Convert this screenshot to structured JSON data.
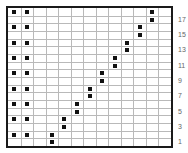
{
  "grid": {
    "columns": 13,
    "rows": 18,
    "row_labels": [
      "17",
      "15",
      "13",
      "11",
      "9",
      "7",
      "5",
      "3",
      "1"
    ],
    "row_label_rows": [
      17,
      15,
      13,
      11,
      9,
      7,
      5,
      3,
      1
    ],
    "colors": {
      "border": "#1a1a1a",
      "gridline": "#b9b9b9",
      "dot": "#111111",
      "label": "#666666"
    }
  },
  "dots": [
    {
      "col": 1,
      "row": 18
    },
    {
      "col": 2,
      "row": 18
    },
    {
      "col": 1,
      "row": 16
    },
    {
      "col": 2,
      "row": 16
    },
    {
      "col": 1,
      "row": 14
    },
    {
      "col": 2,
      "row": 14
    },
    {
      "col": 1,
      "row": 12
    },
    {
      "col": 2,
      "row": 12
    },
    {
      "col": 1,
      "row": 10
    },
    {
      "col": 2,
      "row": 10
    },
    {
      "col": 1,
      "row": 8
    },
    {
      "col": 2,
      "row": 8
    },
    {
      "col": 1,
      "row": 6
    },
    {
      "col": 2,
      "row": 6
    },
    {
      "col": 1,
      "row": 4
    },
    {
      "col": 2,
      "row": 4
    },
    {
      "col": 1,
      "row": 2
    },
    {
      "col": 2,
      "row": 2
    },
    {
      "col": 4,
      "row": 1
    },
    {
      "col": 4,
      "row": 2
    },
    {
      "col": 5,
      "row": 3
    },
    {
      "col": 5,
      "row": 4
    },
    {
      "col": 6,
      "row": 5
    },
    {
      "col": 6,
      "row": 6
    },
    {
      "col": 7,
      "row": 7
    },
    {
      "col": 7,
      "row": 8
    },
    {
      "col": 8,
      "row": 9
    },
    {
      "col": 8,
      "row": 10
    },
    {
      "col": 9,
      "row": 11
    },
    {
      "col": 9,
      "row": 12
    },
    {
      "col": 10,
      "row": 13
    },
    {
      "col": 10,
      "row": 14
    },
    {
      "col": 11,
      "row": 15
    },
    {
      "col": 11,
      "row": 16
    },
    {
      "col": 12,
      "row": 17
    },
    {
      "col": 12,
      "row": 18
    }
  ]
}
